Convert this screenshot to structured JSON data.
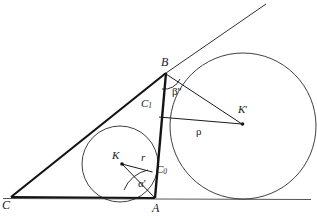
{
  "figure": {
    "background_color": "#ffffff",
    "stroke_color": "#1a1a1a",
    "thick_stroke_color": "#141414",
    "width": 317,
    "height": 218
  },
  "labels": {
    "vertex_a": "A",
    "vertex_b": "B",
    "vertex_c": "C",
    "incenter": "K",
    "excenter": "K",
    "excenter_prime": "'",
    "touch_point_c0": "C",
    "touch_point_c0_sub": "0",
    "touch_point_c1": "C",
    "touch_point_c1_sub": "1",
    "inradius": "r",
    "exradius": "ρ",
    "angle_alpha": "α",
    "angle_alpha_prime": "'",
    "angle_beta": "β",
    "angle_beta_prime": "''"
  },
  "geometry": {
    "points": {
      "A": [
        155,
        198
      ],
      "B": [
        166,
        73
      ],
      "C": [
        11,
        197
      ],
      "K": [
        122,
        164
      ],
      "K_prime": [
        242,
        124
      ],
      "C0": [
        152,
        172
      ],
      "C1": [
        160,
        110
      ]
    },
    "incircle": {
      "cx": 120,
      "cy": 164,
      "r": 38
    },
    "excircle": {
      "cx": 243,
      "cy": 126,
      "r": 73
    },
    "baseline": {
      "x1": 4,
      "y1": 198,
      "x2": 311,
      "y2": 199
    },
    "tangent_ray": {
      "x1": 11,
      "y1": 197,
      "x2": 265,
      "y2": 5
    }
  }
}
